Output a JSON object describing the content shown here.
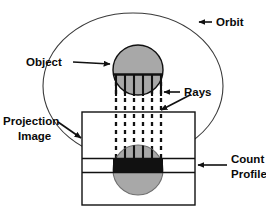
{
  "figure": {
    "background_color": "#ffffff",
    "stroke_color": "#111111",
    "object_fill_color": "#a8a8a8",
    "count_profile_fill_color": "#111111",
    "labels": {
      "orbit": "Orbit",
      "object": "Object",
      "rays": "Rays",
      "projection_image_line1": "Projection",
      "projection_image_line2": "Image",
      "count_profile_line1": "Count",
      "count_profile_line2": "Profile"
    },
    "elements": {
      "orbit_ellipse": {
        "cx": 133,
        "cy": 86,
        "rx": 90,
        "ry": 73
      },
      "object_circle": {
        "cx": 138,
        "cy": 70,
        "r": 25,
        "fill": "#a8a8a8",
        "midline_y": 74
      },
      "projection_rect": {
        "x": 82,
        "y": 112,
        "width": 113,
        "height": 93
      },
      "projection_circle": {
        "cx": 138,
        "cy": 170,
        "r": 25,
        "fill": "#a8a8a8"
      },
      "count_profile_band": {
        "y_top": 158,
        "y_bottom": 172,
        "x_left": 82,
        "x_right": 195,
        "fill": "#111111"
      },
      "rays": {
        "count": 6,
        "x_positions": [
          116,
          125,
          134,
          143,
          152,
          161
        ],
        "y_start": 74,
        "y_end": 172,
        "dash": "4 4"
      }
    }
  }
}
